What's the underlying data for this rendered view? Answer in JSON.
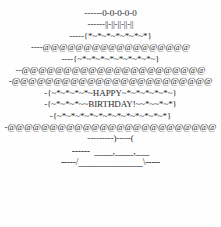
{
  "artwork": {
    "name": "happy-birthday-cake-ascii",
    "subject": "birthday cake",
    "message_line_1": "HAPPY",
    "message_line_2": "BIRTHDAY!",
    "colors": {
      "background": "#fefefe",
      "text": "#2b2b2b"
    },
    "lines": [
      {
        "id": "flames",
        "text": "------0-0-0-0-0"
      },
      {
        "id": "candles",
        "text": "------||-||-||-||-||"
      },
      {
        "id": "icing-top",
        "text": "-----{*~*~*~*~*~*~*}"
      },
      {
        "id": "frosting-1",
        "text": "----@@@@@@@@@@@@@@@@@@"
      },
      {
        "id": "icing-2",
        "text": "----{~*~*~*~*~*~*~*~*~}"
      },
      {
        "id": "frosting-2",
        "text": "--@@@@@@@@@@@@@@@@@@@@@@"
      },
      {
        "id": "frosting-3",
        "text": "-@@@@@@@@@@@@@@@@@@@@@@@@"
      },
      {
        "id": "happy",
        "text": "-{~*~*~*~*~HAPPY~*~*~*~*~*~}"
      },
      {
        "id": "birthday",
        "text": "-{~*~*~*~~BIRTHDAY!~~*~~*~*}"
      },
      {
        "id": "icing-3",
        "text": "-{~*~*~*~*~*~*~*~*~*~*~*~*}"
      },
      {
        "id": "frosting-4",
        "text": "-@@@@@@@@@@@@@@@@@@@@@@@@@"
      },
      {
        "id": "plate-gap",
        "text": "---------)-----("
      },
      {
        "id": "base-top",
        "text": "------  ____,____,___"
      },
      {
        "id": "base-bottom",
        "text": "-----/______________\\-----"
      }
    ]
  }
}
